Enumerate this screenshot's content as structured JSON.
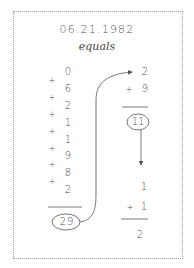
{
  "title": "06.21.1982",
  "subtitle": "equals",
  "left_column": {
    "digits": [
      "0",
      "6",
      "2",
      "1",
      "1",
      "9",
      "8",
      "2"
    ],
    "operator": "+",
    "sum": "29"
  },
  "right_column": {
    "step1": {
      "top": "2",
      "operator": "+",
      "bottom": "9",
      "sum": "11"
    },
    "step2": {
      "top": "1",
      "operator": "+",
      "bottom": "1",
      "sum": "2"
    }
  },
  "colors": {
    "ink": "#4a4a4a",
    "border": "#9a9a9a",
    "background": "#ffffff"
  }
}
